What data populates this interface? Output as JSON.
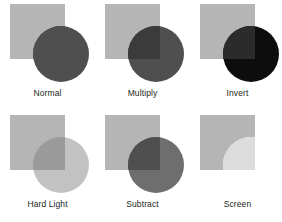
{
  "figure": {
    "background": "#ffffff",
    "columns": 3,
    "rows": 2
  },
  "shapes": {
    "square_label": "base square",
    "circle_label": "blend circle",
    "square_base_color": "#b3b3b3",
    "circle_base_color": "#4d4d4d"
  },
  "cells": [
    {
      "label": "Normal",
      "square_color": "#b5b5b5",
      "circle_color": "#4f4f4f",
      "overlap_color": "#4f4f4f",
      "blend_mode": "normal"
    },
    {
      "label": "Multiply",
      "square_color": "#b5b5b5",
      "circle_color": "#4f4f4f",
      "overlap_color": "#3b3b3b",
      "blend_mode": "multiply"
    },
    {
      "label": "Invert",
      "square_color": "#b5b5b5",
      "circle_color": "#0d0d0d",
      "overlap_color": "#2b2b2b",
      "blend_mode": "invert"
    },
    {
      "label": "Hard Light",
      "square_color": "#b5b5b5",
      "circle_color": "#c2c2c2",
      "overlap_color": "#9a9a9a",
      "blend_mode": "hard-light"
    },
    {
      "label": "Subtract",
      "square_color": "#b5b5b5",
      "circle_color": "#6e6e6e",
      "overlap_color": "#4f4f4f",
      "blend_mode": "subtract"
    },
    {
      "label": "Screen",
      "square_color": "#b5b5b5",
      "circle_color": "#ffffff",
      "overlap_color": "#dcdcdc",
      "blend_mode": "screen"
    }
  ]
}
